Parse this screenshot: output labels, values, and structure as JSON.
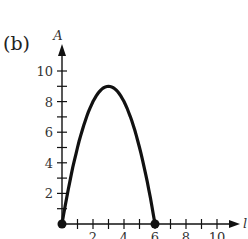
{
  "part_label": "(b)",
  "chart_data": {
    "type": "line",
    "title": "",
    "xlabel": "l",
    "ylabel": "A",
    "xlim": [
      0,
      11
    ],
    "ylim": [
      0,
      11
    ],
    "x_ticks": [
      1,
      2,
      3,
      4,
      5,
      6,
      7,
      8,
      9,
      10
    ],
    "x_tick_labels": [
      "2",
      "4",
      "6",
      "8",
      "10"
    ],
    "y_ticks": [
      1,
      2,
      3,
      4,
      5,
      6,
      7,
      8,
      9,
      10
    ],
    "y_tick_labels": [
      "2",
      "4",
      "6",
      "8",
      "10"
    ],
    "grid": false,
    "series": [
      {
        "name": "A = x(6 - x)",
        "x": [
          0,
          0.5,
          1,
          1.5,
          2,
          2.5,
          3,
          3.5,
          4,
          4.5,
          5,
          5.5,
          6
        ],
        "values": [
          0,
          2.75,
          5,
          6.75,
          8,
          8.75,
          9,
          8.75,
          8,
          6.75,
          5,
          2.75,
          0
        ]
      }
    ],
    "endpoints": [
      [
        0,
        0
      ],
      [
        6,
        0
      ]
    ],
    "color": "#111111"
  }
}
